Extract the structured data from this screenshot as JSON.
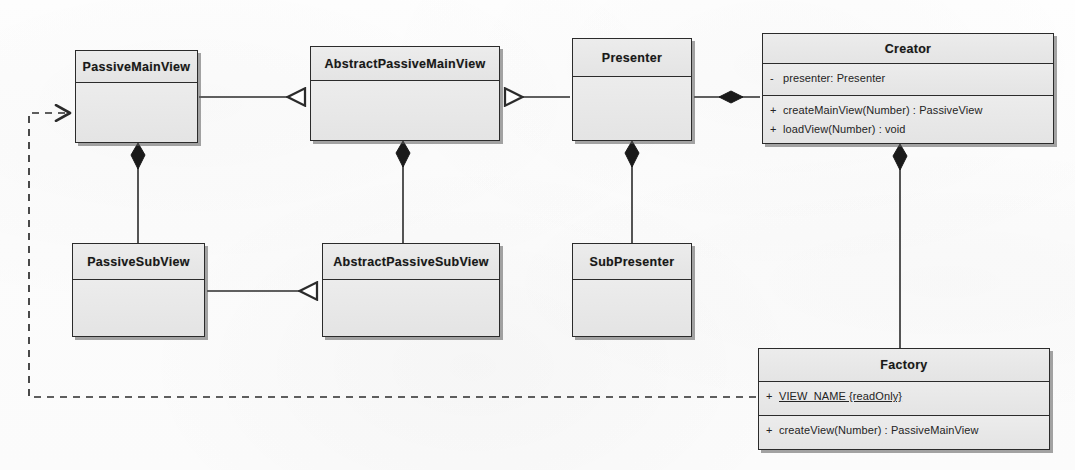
{
  "diagram": {
    "type": "uml-class-diagram",
    "background_color": "#fdfdfd",
    "class_fill_color": "#e9e9e9",
    "line_color": "#2b2b2b"
  },
  "classes": [
    {
      "id": "passive-main-view",
      "name": "PassiveMainView",
      "x": 75,
      "y": 50,
      "width": 123,
      "height": 93,
      "header_height": 32,
      "attributes": [],
      "operations": []
    },
    {
      "id": "abstract-passive-main-view",
      "name": "AbstractPassiveMainView",
      "x": 310,
      "y": 46,
      "width": 190,
      "height": 95,
      "header_height": 34,
      "attributes": [],
      "operations": []
    },
    {
      "id": "presenter",
      "name": "Presenter",
      "x": 572,
      "y": 38,
      "width": 120,
      "height": 103,
      "header_height": 38,
      "attributes": [],
      "operations": []
    },
    {
      "id": "creator",
      "name": "Creator",
      "x": 762,
      "y": 33,
      "width": 292,
      "height": 111,
      "header_height": 30,
      "attributes": [
        {
          "visibility": "-",
          "text": "presenter:  Presenter",
          "static": false
        }
      ],
      "operations": [
        {
          "visibility": "+",
          "text": "createMainView(Number) : PassiveView",
          "static": false
        },
        {
          "visibility": "+",
          "text": "loadView(Number) : void",
          "static": false
        }
      ]
    },
    {
      "id": "passive-sub-view",
      "name": "PassiveSubView",
      "x": 72,
      "y": 243,
      "width": 133,
      "height": 94,
      "header_height": 36,
      "attributes": [],
      "operations": []
    },
    {
      "id": "abstract-passive-sub-view",
      "name": "AbstractPassiveSubView",
      "x": 322,
      "y": 243,
      "width": 178,
      "height": 94,
      "header_height": 36,
      "attributes": [],
      "operations": []
    },
    {
      "id": "sub-presenter",
      "name": "SubPresenter",
      "x": 572,
      "y": 243,
      "width": 120,
      "height": 94,
      "header_height": 36,
      "attributes": [],
      "operations": []
    },
    {
      "id": "factory",
      "name": "Factory",
      "x": 758,
      "y": 348,
      "width": 292,
      "height": 102,
      "header_height": 33,
      "attributes": [
        {
          "visibility": "+",
          "text": "VIEW_NAME {readOnly}",
          "static": true
        }
      ],
      "operations": [
        {
          "visibility": "+",
          "text": "createView(Number) : PassiveMainView",
          "static": false
        }
      ]
    }
  ],
  "relationships": [
    {
      "id": "rel-generalization-main-view",
      "kind": "generalization",
      "from": "PassiveMainView",
      "to": "AbstractPassiveMainView",
      "style": "solid",
      "arrowhead": "hollow-triangle"
    },
    {
      "id": "rel-realization-presenter",
      "kind": "generalization",
      "from": "Presenter",
      "to": "AbstractPassiveMainView",
      "style": "solid",
      "arrowhead": "hollow-triangle"
    },
    {
      "id": "rel-composition-creator-presenter",
      "kind": "composition",
      "from": "Creator",
      "to": "Presenter",
      "style": "solid",
      "arrowhead": "filled-diamond"
    },
    {
      "id": "rel-composition-main-sub-view",
      "kind": "composition",
      "from": "PassiveMainView",
      "to": "PassiveSubView",
      "style": "solid",
      "arrowhead": "filled-diamond"
    },
    {
      "id": "rel-composition-abstract-main-sub",
      "kind": "composition",
      "from": "AbstractPassiveMainView",
      "to": "AbstractPassiveSubView",
      "style": "solid",
      "arrowhead": "filled-diamond"
    },
    {
      "id": "rel-composition-presenter-subpresenter",
      "kind": "composition",
      "from": "Presenter",
      "to": "SubPresenter",
      "style": "solid",
      "arrowhead": "filled-diamond"
    },
    {
      "id": "rel-composition-creator-factory",
      "kind": "composition",
      "from": "Creator",
      "to": "Factory",
      "style": "solid",
      "arrowhead": "filled-diamond"
    },
    {
      "id": "rel-generalization-sub-view",
      "kind": "generalization",
      "from": "PassiveSubView",
      "to": "AbstractPassiveSubView",
      "style": "solid",
      "arrowhead": "hollow-triangle"
    },
    {
      "id": "rel-dependency-factory-main-view",
      "kind": "dependency",
      "from": "Factory",
      "to": "PassiveMainView",
      "style": "dashed",
      "arrowhead": "open-arrow"
    }
  ]
}
